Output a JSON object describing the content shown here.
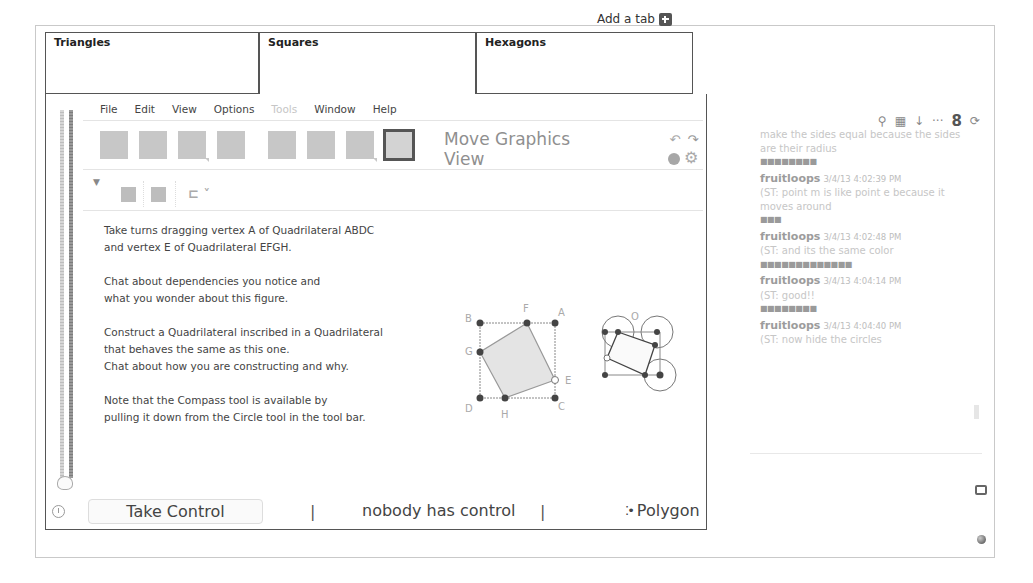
{
  "tabs_bar": {
    "add_tab_label": "Add a tab",
    "tabs": [
      {
        "label": "Triangles",
        "active": false
      },
      {
        "label": "Squares",
        "active": true
      },
      {
        "label": "Hexagons",
        "active": false
      }
    ]
  },
  "geogebra": {
    "menu": [
      {
        "label": "File",
        "enabled": true
      },
      {
        "label": "Edit",
        "enabled": true
      },
      {
        "label": "View",
        "enabled": true
      },
      {
        "label": "Options",
        "enabled": true
      },
      {
        "label": "Tools",
        "enabled": false
      },
      {
        "label": "Window",
        "enabled": true
      },
      {
        "label": "Help",
        "enabled": true
      }
    ],
    "toolbar": {
      "tool_icons": [
        "move-tool-icon",
        "point-tool-icon",
        "line-tool-icon",
        "perpendicular-tool-icon",
        "polygon-tool-icon",
        "circle-tool-icon",
        "angle-tool-icon",
        "move-graphics-view-tool-icon"
      ],
      "selected_tool_title": "Move Graphics View"
    },
    "instructions": [
      "Take turns dragging vertex A of Quadrilateral ABDC\nand vertex E of Quadrilateral EFGH.",
      "Chat about dependencies you notice and\nwhat you wonder about this figure.",
      "Construct a Quadrilateral inscribed in a Quadrilateral\nthat behaves the same as this one.\nChat about how you are constructing and why.",
      "Note that the Compass tool is available by\npulling it down from the Circle tool in the tool bar."
    ],
    "figure_labels": {
      "outer": [
        "A",
        "B",
        "C",
        "D"
      ],
      "inner": [
        "E",
        "F",
        "G",
        "H"
      ],
      "second_figure_label": "O"
    }
  },
  "statusbar": {
    "take_control_label": "Take Control",
    "separator": "|",
    "control_status": "nobody has control",
    "current_tool": "Polygon"
  },
  "chat": {
    "messages": [
      {
        "user": "",
        "timestamp": "",
        "text": "make the sides equal because the sides are their radius",
        "separator": "■■■■■■■■"
      },
      {
        "user": "fruitloops",
        "timestamp": "3/4/13 4:02:39 PM",
        "text": "(ST: point m is like point e because it moves around",
        "separator": "■■■"
      },
      {
        "user": "fruitloops",
        "timestamp": "3/4/13 4:02:48 PM",
        "text": "(ST: and its the same color",
        "separator": "■■■■■■■■■■■■■"
      },
      {
        "user": "fruitloops",
        "timestamp": "3/4/13 4:04:14 PM",
        "text": "(ST: good!!",
        "separator": "■■■■■■■■"
      },
      {
        "user": "fruitloops",
        "timestamp": "3/4/13 4:04:40 PM",
        "text": "(ST: now hide the circles",
        "separator": ""
      }
    ],
    "input_value": ""
  }
}
